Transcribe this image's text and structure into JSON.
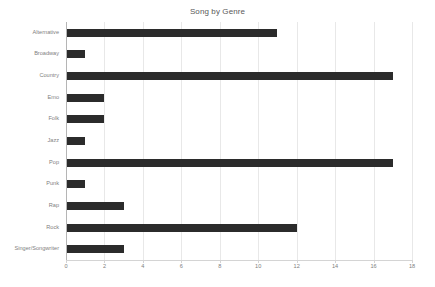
{
  "chart_data": {
    "type": "bar",
    "orientation": "horizontal",
    "title": "Song by Genre",
    "xlabel": "",
    "ylabel": "",
    "categories": [
      "Alternative",
      "Broadway",
      "Country",
      "Emo",
      "Folk",
      "Jazz",
      "Pop",
      "Punk",
      "Rap",
      "Rock",
      "Singer/Songwriter"
    ],
    "values": [
      11,
      1,
      17,
      2,
      2,
      1,
      17,
      1,
      3,
      12,
      3
    ],
    "xlim": [
      0,
      18
    ],
    "xticks": [
      0,
      2,
      4,
      6,
      8,
      10,
      12,
      14,
      16,
      18
    ],
    "xtick_labels": [
      "0",
      "2",
      "4",
      "6",
      "8",
      "10",
      "12",
      "14",
      "16",
      "18"
    ],
    "grid": "vertical",
    "legend": "none",
    "bar_color": "#2b2b2b",
    "gridline_color": "#e8e8e8",
    "axis_color": "#b5b5b5",
    "text_color": "#808080",
    "title_color": "#595959",
    "background_color": "#ffffff"
  }
}
